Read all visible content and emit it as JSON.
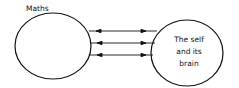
{
  "diagram": {
    "left_node": {
      "label": "Maths"
    },
    "right_node": {
      "lines": [
        "The self",
        "and its",
        "brain"
      ]
    },
    "connections": [
      {
        "type": "bidirectional-arrow"
      },
      {
        "type": "bidirectional-arrow"
      },
      {
        "type": "bidirectional-arrow"
      }
    ],
    "colors": {
      "stroke": "#111111",
      "background": "#ffffff"
    }
  }
}
